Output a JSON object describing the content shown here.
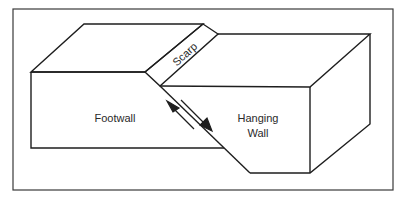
{
  "diagram": {
    "type": "normal-fault block diagram",
    "labels": {
      "scarp": "Scarp",
      "footwall": "Footwall",
      "hanging_wall_line1": "Hanging",
      "hanging_wall_line2": "Wall"
    },
    "arrows": [
      {
        "name": "footwall-motion-arrow",
        "direction": "up-left"
      },
      {
        "name": "hanging-wall-motion-arrow",
        "direction": "down-right"
      }
    ],
    "colors": {
      "line": "#1e1e1e",
      "frame": "#3a3a3a",
      "background": "#ffffff"
    }
  }
}
